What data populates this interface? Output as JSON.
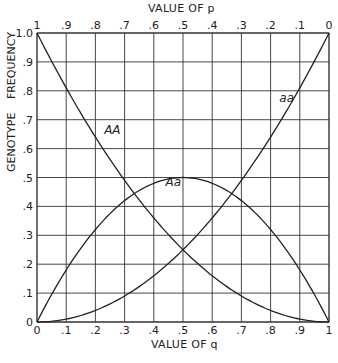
{
  "chart_data": {
    "type": "line",
    "title": "",
    "xlabel": "VALUE OF q",
    "x2label": "VALUE OF p",
    "ylabel": "GENOTYPE FREQUENCY",
    "xlim": [
      0,
      1
    ],
    "ylim": [
      0,
      1
    ],
    "grid": true,
    "x_ticks": [
      "0",
      ".1",
      ".2",
      ".3",
      ".4",
      ".5",
      ".6",
      ".7",
      ".8",
      ".9",
      "1"
    ],
    "x2_ticks": [
      "1",
      ".9",
      ".8",
      ".7",
      ".6",
      ".5",
      ".4",
      ".3",
      ".2",
      ".1",
      "0"
    ],
    "y_ticks": [
      "0",
      ".1",
      ".2",
      ".3",
      ".4",
      ".5",
      ".6",
      ".7",
      ".8",
      ".9",
      "1.0"
    ],
    "x": [
      0,
      0.1,
      0.2,
      0.3,
      0.4,
      0.5,
      0.6,
      0.7,
      0.8,
      0.9,
      1.0
    ],
    "series": [
      {
        "name": "AA",
        "formula": "p^2",
        "values": [
          1.0,
          0.81,
          0.64,
          0.49,
          0.36,
          0.25,
          0.16,
          0.09,
          0.04,
          0.01,
          0.0
        ]
      },
      {
        "name": "Aa",
        "formula": "2pq",
        "values": [
          0.0,
          0.18,
          0.32,
          0.42,
          0.48,
          0.5,
          0.48,
          0.42,
          0.32,
          0.18,
          0.0
        ]
      },
      {
        "name": "aa",
        "formula": "q^2",
        "values": [
          0.0,
          0.01,
          0.04,
          0.09,
          0.16,
          0.25,
          0.36,
          0.49,
          0.64,
          0.81,
          1.0
        ]
      }
    ],
    "annotations": [
      {
        "text": "AA",
        "x": 0.23,
        "y": 0.65
      },
      {
        "text": "Aa",
        "x": 0.44,
        "y": 0.47
      },
      {
        "text": "aa",
        "x": 0.83,
        "y": 0.76
      }
    ]
  },
  "labels": {
    "xlabel": "VALUE OF q",
    "x2label": "VALUE OF p",
    "ylabel": "GENOTYPE FREQUENCY"
  }
}
